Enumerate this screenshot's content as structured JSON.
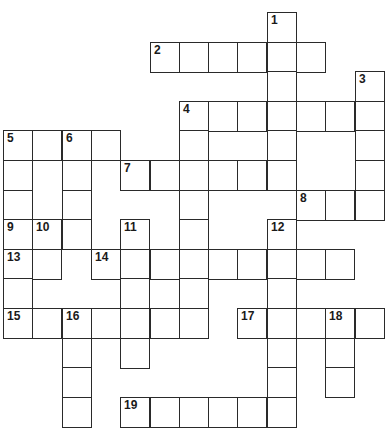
{
  "header": {
    "text": ""
  },
  "grid": {
    "origin_x": 3,
    "origin_y": 12,
    "cell_w": 29.3,
    "cell_h": 29.6,
    "cells": [
      {
        "r": 0,
        "c": 9,
        "n": "1"
      },
      {
        "r": 1,
        "c": 5,
        "n": "2"
      },
      {
        "r": 1,
        "c": 6
      },
      {
        "r": 1,
        "c": 7
      },
      {
        "r": 1,
        "c": 8
      },
      {
        "r": 1,
        "c": 9
      },
      {
        "r": 1,
        "c": 10
      },
      {
        "r": 2,
        "c": 9
      },
      {
        "r": 2,
        "c": 12,
        "n": "3"
      },
      {
        "r": 3,
        "c": 6,
        "n": "4"
      },
      {
        "r": 3,
        "c": 7
      },
      {
        "r": 3,
        "c": 8
      },
      {
        "r": 3,
        "c": 9
      },
      {
        "r": 3,
        "c": 10
      },
      {
        "r": 3,
        "c": 11
      },
      {
        "r": 3,
        "c": 12
      },
      {
        "r": 4,
        "c": 0,
        "n": "5"
      },
      {
        "r": 4,
        "c": 1
      },
      {
        "r": 4,
        "c": 2,
        "n": "6"
      },
      {
        "r": 4,
        "c": 3
      },
      {
        "r": 4,
        "c": 6
      },
      {
        "r": 4,
        "c": 9
      },
      {
        "r": 4,
        "c": 12
      },
      {
        "r": 5,
        "c": 0
      },
      {
        "r": 5,
        "c": 2
      },
      {
        "r": 5,
        "c": 4,
        "n": "7"
      },
      {
        "r": 5,
        "c": 5
      },
      {
        "r": 5,
        "c": 6
      },
      {
        "r": 5,
        "c": 7
      },
      {
        "r": 5,
        "c": 8
      },
      {
        "r": 5,
        "c": 9
      },
      {
        "r": 5,
        "c": 12
      },
      {
        "r": 6,
        "c": 0
      },
      {
        "r": 6,
        "c": 2
      },
      {
        "r": 6,
        "c": 6
      },
      {
        "r": 6,
        "c": 10,
        "n": "8"
      },
      {
        "r": 6,
        "c": 11
      },
      {
        "r": 6,
        "c": 12
      },
      {
        "r": 7,
        "c": 0,
        "n": "9"
      },
      {
        "r": 7,
        "c": 1,
        "n": "10"
      },
      {
        "r": 7,
        "c": 2
      },
      {
        "r": 7,
        "c": 4,
        "n": "11"
      },
      {
        "r": 7,
        "c": 6
      },
      {
        "r": 7,
        "c": 9,
        "n": "12"
      },
      {
        "r": 8,
        "c": 0,
        "n": "13"
      },
      {
        "r": 8,
        "c": 1
      },
      {
        "r": 8,
        "c": 3,
        "n": "14"
      },
      {
        "r": 8,
        "c": 4
      },
      {
        "r": 8,
        "c": 5
      },
      {
        "r": 8,
        "c": 6
      },
      {
        "r": 8,
        "c": 7
      },
      {
        "r": 8,
        "c": 8
      },
      {
        "r": 8,
        "c": 9
      },
      {
        "r": 8,
        "c": 10
      },
      {
        "r": 8,
        "c": 11
      },
      {
        "r": 9,
        "c": 0
      },
      {
        "r": 9,
        "c": 4
      },
      {
        "r": 9,
        "c": 6
      },
      {
        "r": 9,
        "c": 9
      },
      {
        "r": 10,
        "c": 0,
        "n": "15"
      },
      {
        "r": 10,
        "c": 1
      },
      {
        "r": 10,
        "c": 2,
        "n": "16"
      },
      {
        "r": 10,
        "c": 3
      },
      {
        "r": 10,
        "c": 4
      },
      {
        "r": 10,
        "c": 5
      },
      {
        "r": 10,
        "c": 6
      },
      {
        "r": 10,
        "c": 8,
        "n": "17"
      },
      {
        "r": 10,
        "c": 9
      },
      {
        "r": 10,
        "c": 10
      },
      {
        "r": 10,
        "c": 11,
        "n": "18"
      },
      {
        "r": 10,
        "c": 12
      },
      {
        "r": 11,
        "c": 2
      },
      {
        "r": 11,
        "c": 4
      },
      {
        "r": 11,
        "c": 9
      },
      {
        "r": 11,
        "c": 11
      },
      {
        "r": 12,
        "c": 2
      },
      {
        "r": 12,
        "c": 9
      },
      {
        "r": 12,
        "c": 11
      },
      {
        "r": 13,
        "c": 2
      },
      {
        "r": 13,
        "c": 4,
        "n": "19"
      },
      {
        "r": 13,
        "c": 5
      },
      {
        "r": 13,
        "c": 6
      },
      {
        "r": 13,
        "c": 7
      },
      {
        "r": 13,
        "c": 8
      },
      {
        "r": 13,
        "c": 9
      }
    ]
  },
  "clue_numbers": {
    "across": [
      "2",
      "4",
      "5",
      "7",
      "8",
      "9",
      "13",
      "14",
      "15",
      "17",
      "19"
    ],
    "down": [
      "1",
      "3",
      "4",
      "5",
      "6",
      "10",
      "11",
      "12",
      "16",
      "18"
    ]
  },
  "colors": {
    "line": "#2a2a2a",
    "background": "#ffffff",
    "number": "#1a1a1a"
  }
}
